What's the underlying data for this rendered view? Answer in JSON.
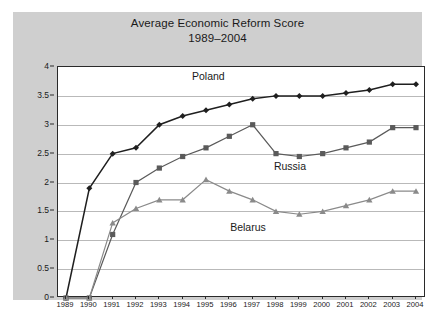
{
  "chart_data": {
    "type": "line",
    "title": "Average Economic Reform Score",
    "subtitle": "1989–2004",
    "xlabel": "",
    "ylabel": "",
    "categories": [
      "1989",
      "1990",
      "1991",
      "1992",
      "1993",
      "1994",
      "1995",
      "1996",
      "1997",
      "1998",
      "1999",
      "2000",
      "2001",
      "2002",
      "2003",
      "2004"
    ],
    "x": [
      1989,
      1990,
      1991,
      1992,
      1993,
      1994,
      1995,
      1996,
      1997,
      1998,
      1999,
      2000,
      2001,
      2002,
      2003,
      2004
    ],
    "ylim": [
      0,
      4
    ],
    "yticks": [
      "0",
      "0.5",
      "1",
      "1.5",
      "2",
      "2.5",
      "3",
      "3.5",
      "4"
    ],
    "ytick_values": [
      0,
      0.5,
      1,
      1.5,
      2,
      2.5,
      3,
      3.5,
      4
    ],
    "grid": true,
    "legend_position": "inline-annotations",
    "series": [
      {
        "name": "Poland",
        "color": "#1f1f1f",
        "marker": "diamond",
        "values": [
          0,
          1.9,
          2.5,
          2.6,
          3.0,
          3.15,
          3.25,
          3.35,
          3.45,
          3.5,
          3.5,
          3.5,
          3.55,
          3.6,
          3.7,
          3.7
        ]
      },
      {
        "name": "Russia",
        "color": "#5a5a5a",
        "marker": "square",
        "values": [
          0,
          0,
          1.1,
          2.0,
          2.25,
          2.45,
          2.6,
          2.8,
          3.0,
          2.5,
          2.45,
          2.5,
          2.6,
          2.7,
          2.95,
          2.95
        ]
      },
      {
        "name": "Belarus",
        "color": "#8a8a8a",
        "marker": "triangle",
        "values": [
          0,
          0,
          1.3,
          1.55,
          1.7,
          1.7,
          2.05,
          1.85,
          1.7,
          1.5,
          1.45,
          1.5,
          1.6,
          1.7,
          1.85,
          1.85
        ]
      }
    ],
    "annotations": [
      {
        "text": "Poland",
        "x": 1995.1,
        "y": 3.82
      },
      {
        "text": "Russia",
        "x": 1998.6,
        "y": 2.26
      },
      {
        "text": "Belarus",
        "x": 1996.8,
        "y": 1.22
      }
    ]
  },
  "colors": {
    "panel_background": "#cfcfcf",
    "plot_background": "#ffffff",
    "axis": "#2a2a2a",
    "gridline": "#b9b9b9",
    "text": "#1a1a1a"
  }
}
